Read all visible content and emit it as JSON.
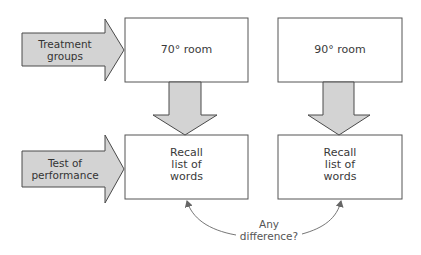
{
  "diagram": {
    "colors": {
      "arrow_fill": "#d3d3d3",
      "arrow_stroke": "#4a4a4a",
      "box_stroke": "#555555",
      "connector": "#666666",
      "text": "#3a3a3a"
    },
    "row_arrows": [
      {
        "id": "treatment",
        "lines": [
          "Treatment",
          "groups"
        ]
      },
      {
        "id": "test",
        "lines": [
          "Test of",
          "performance"
        ]
      }
    ],
    "boxes": {
      "room_70": {
        "lines": [
          "70° room"
        ]
      },
      "room_90": {
        "lines": [
          "90° room"
        ]
      },
      "recall_left": {
        "lines": [
          "Recall",
          "list of",
          "words"
        ]
      },
      "recall_right": {
        "lines": [
          "Recall",
          "list of",
          "words"
        ]
      }
    },
    "comparison": {
      "lines": [
        "Any",
        "difference?"
      ]
    }
  }
}
